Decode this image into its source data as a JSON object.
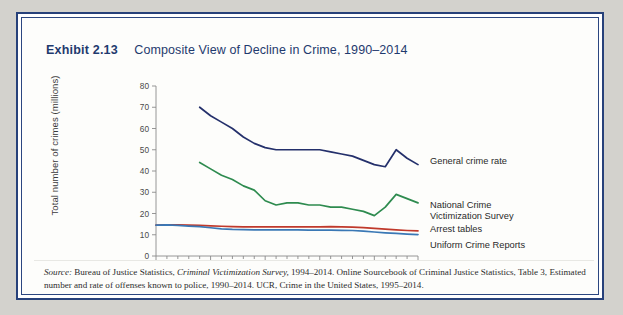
{
  "exhibit": {
    "label": "Exhibit 2.13",
    "title": "Composite View of Decline in Crime, 1990–2014"
  },
  "source_note": {
    "label": "Source:",
    "line1_a": " Bureau of Justice Statistics, ",
    "line1_italic": "Criminal Victimization Survey,",
    "line1_b": " 1994–2014. Online Sourcebook of Criminal Justice Statistics,",
    "line2": "Table 3, Estimated number and rate of offenses known to police, 1990–2014. UCR, Crime in the United States, 1995–2014."
  },
  "colors": {
    "frame": "#27417a",
    "general_crime_rate": "#24306b",
    "ncvs": "#2e8b4f",
    "arrest_tables": "#c0392b",
    "ucr": "#3a78b5",
    "axis": "#8a8a8a",
    "background": "#d3d2cd"
  },
  "chart_data": {
    "type": "line",
    "title": "Composite View of Decline in Crime, 1990–2014",
    "xlabel": "",
    "ylabel": "Total number of crimes (millions)",
    "xlim": [
      1990,
      2014
    ],
    "ylim": [
      0,
      80
    ],
    "yticks": [
      0,
      10,
      20,
      30,
      40,
      50,
      60,
      70,
      80
    ],
    "ytick_labels": [
      "0",
      "10",
      "20",
      "30",
      "40",
      "50",
      "60",
      "70",
      "80"
    ],
    "xticks": [
      1990,
      1995,
      2000,
      2005,
      2010,
      2014
    ],
    "xtick_labels": [
      "1990",
      "1995",
      "2000",
      "2005",
      "2010",
      "2014"
    ],
    "xminor_step": 1,
    "grid": false,
    "legend_position": "right-inline-labels",
    "series": [
      {
        "name": "General crime rate",
        "color": "#24306b",
        "label_lines": [
          "General crime rate"
        ],
        "x": [
          1994,
          1995,
          1996,
          1997,
          1998,
          1999,
          2000,
          2001,
          2002,
          2003,
          2004,
          2005,
          2006,
          2007,
          2008,
          2009,
          2010,
          2011,
          2012,
          2013,
          2014
        ],
        "y": [
          70,
          66,
          63,
          60,
          56,
          53,
          51,
          50,
          50,
          50,
          50,
          50,
          49,
          48,
          47,
          45,
          43,
          42,
          50,
          46,
          43
        ]
      },
      {
        "name": "National Crime Victimization Survey",
        "color": "#2e8b4f",
        "label_lines": [
          "National Crime",
          "Victimization Survey"
        ],
        "x": [
          1994,
          1995,
          1996,
          1997,
          1998,
          1999,
          2000,
          2001,
          2002,
          2003,
          2004,
          2005,
          2006,
          2007,
          2008,
          2009,
          2010,
          2011,
          2012,
          2013,
          2014
        ],
        "y": [
          44,
          41,
          38,
          36,
          33,
          31,
          26,
          24,
          25,
          25,
          24,
          24,
          23,
          23,
          22,
          21,
          19,
          23,
          29,
          27,
          25
        ]
      },
      {
        "name": "Arrest tables",
        "color": "#c0392b",
        "label_lines": [
          "Arrest tables"
        ],
        "x": [
          1990,
          1991,
          1992,
          1993,
          1994,
          1995,
          1996,
          1997,
          1998,
          1999,
          2000,
          2001,
          2002,
          2003,
          2004,
          2005,
          2006,
          2007,
          2008,
          2009,
          2010,
          2011,
          2012,
          2013,
          2014
        ],
        "y": [
          14.5,
          14.7,
          14.6,
          14.5,
          14.4,
          14.2,
          14.0,
          13.8,
          13.7,
          13.7,
          13.7,
          13.7,
          13.7,
          13.7,
          13.7,
          13.7,
          13.8,
          13.7,
          13.6,
          13.4,
          13.0,
          12.6,
          12.3,
          12.0,
          11.8
        ]
      },
      {
        "name": "Uniform Crime Reports",
        "color": "#3a78b5",
        "label_lines": [
          "Uniform Crime Reports"
        ],
        "x": [
          1990,
          1991,
          1992,
          1993,
          1994,
          1995,
          1996,
          1997,
          1998,
          1999,
          2000,
          2001,
          2002,
          2003,
          2004,
          2005,
          2006,
          2007,
          2008,
          2009,
          2010,
          2011,
          2012,
          2013,
          2014
        ],
        "y": [
          14.5,
          14.6,
          14.4,
          14.1,
          13.8,
          13.3,
          12.8,
          12.5,
          12.4,
          12.3,
          12.3,
          12.3,
          12.3,
          12.3,
          12.2,
          12.2,
          12.2,
          12.1,
          12.0,
          11.7,
          11.3,
          10.9,
          10.6,
          10.3,
          10.1
        ]
      }
    ]
  }
}
